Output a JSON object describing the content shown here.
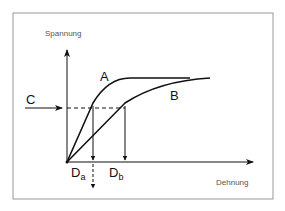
{
  "diagram": {
    "y_axis_label": "Spannung",
    "x_axis_label": "Dehnung",
    "curves": [
      {
        "label": "A",
        "description": "steep curve reaching plateau"
      },
      {
        "label": "B",
        "description": "flatter curve rising gradually"
      }
    ],
    "stress_level_label": "C",
    "strain_markers": [
      {
        "main": "D",
        "sub": "a"
      },
      {
        "main": "D",
        "sub": "b"
      }
    ],
    "colors": {
      "line": "#111111",
      "frame": "#888888",
      "text": "#555555"
    }
  }
}
